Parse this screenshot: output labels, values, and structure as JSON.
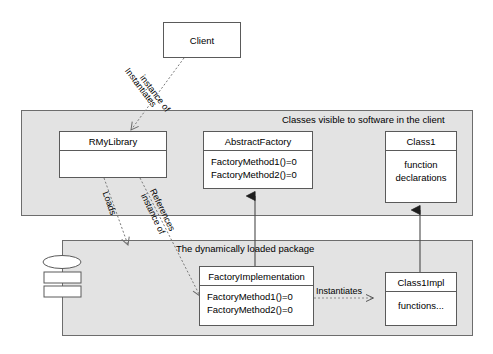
{
  "diagram": {
    "background_color": "#ffffff",
    "panel_fill": "#e3e3e3",
    "box_fill": "#ffffff",
    "line_color": "#5a5a5a"
  },
  "panels": [
    {
      "id": "client-visible-panel",
      "label": "Classes visible to software in the client"
    },
    {
      "id": "dynamic-package-panel",
      "label": "The dynamically loaded package"
    }
  ],
  "boxes": {
    "client": {
      "name": "Client"
    },
    "rmylibrary": {
      "name": "RMyLibrary",
      "members": []
    },
    "abstractfactory": {
      "name": "AbstractFactory",
      "members": [
        "FactoryMethod1()=0",
        "FactoryMethod2()=0"
      ]
    },
    "class1": {
      "name": "Class1",
      "members": [
        "function",
        "declarations"
      ]
    },
    "factoryimplementation": {
      "name": "FactoryImplementation",
      "members": [
        "FactoryMethod1()=0",
        "FactoryMethod2()=0"
      ]
    },
    "class1impl": {
      "name": "Class1Impl",
      "members": [
        "functions..."
      ]
    }
  },
  "edges": {
    "instantiates_client": {
      "label_line1": "Instantiates",
      "label_line2": "instance of"
    },
    "loads": {
      "label": "Loads"
    },
    "references": {
      "label_line1": "References",
      "label_line2": "instance of"
    },
    "instantiates_factory": {
      "label": "Instantiates"
    }
  },
  "icons": {
    "disk_stack": "disk-stack-icon"
  }
}
